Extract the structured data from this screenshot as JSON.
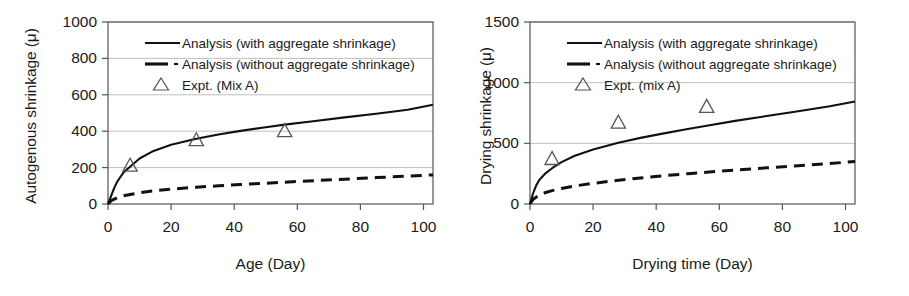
{
  "figure": {
    "background": "#ffffff",
    "axis_color": "#3a3a3a",
    "grid_color": "#bfbfbf",
    "series_color": "#111111",
    "marker_color": "#555555"
  },
  "panels": [
    {
      "id": "autogenous-shrinkage",
      "ylabel": "Autogenous shrinkage (μ)",
      "xlabel": "Age (Day)",
      "yticks": [
        "0",
        "200",
        "400",
        "600",
        "800",
        "1000"
      ],
      "xticks": [
        "0",
        "20",
        "40",
        "60",
        "80",
        "100"
      ],
      "legend": [
        {
          "marker": "solid-line",
          "label": "Analysis (with aggregate shrinkage)"
        },
        {
          "marker": "dash-dot-line",
          "label": "Analysis (without aggregate shrinkage)"
        },
        {
          "marker": "open-triangle",
          "label": "Expt. (Mix A)"
        }
      ]
    },
    {
      "id": "drying-shrinkage",
      "ylabel": "Drying shrinkage (μ)",
      "xlabel": "Drying time (Day)",
      "yticks": [
        "0",
        "500",
        "1000",
        "1500"
      ],
      "xticks": [
        "0",
        "20",
        "40",
        "60",
        "80",
        "100"
      ],
      "legend": [
        {
          "marker": "solid-line",
          "label": "Analysis (with aggregate shrinkage)"
        },
        {
          "marker": "dash-dot-line",
          "label": "Analysis (without aggregate shrinkage)"
        },
        {
          "marker": "open-triangle",
          "label": "Expt. (mix A)"
        }
      ]
    }
  ],
  "chart_data": [
    {
      "type": "line",
      "title": "",
      "xlabel": "Age (Day)",
      "ylabel": "Autogenous shrinkage (μ)",
      "xlim": [
        0,
        103
      ],
      "ylim": [
        0,
        1000
      ],
      "xticks": [
        0,
        20,
        40,
        60,
        80,
        100
      ],
      "yticks": [
        0,
        200,
        400,
        600,
        800,
        1000
      ],
      "grid": "horizontal",
      "legend_position": "upper-left-inside",
      "series": [
        {
          "name": "Analysis (with aggregate shrinkage)",
          "style": "solid",
          "x": [
            0,
            1,
            2,
            3,
            5,
            7,
            10,
            14,
            20,
            28,
            35,
            42,
            50,
            56,
            65,
            75,
            85,
            95,
            103
          ],
          "y": [
            0,
            45,
            90,
            125,
            175,
            205,
            250,
            288,
            325,
            358,
            382,
            402,
            422,
            436,
            455,
            476,
            496,
            518,
            545
          ]
        },
        {
          "name": "Analysis (without aggregate shrinkage)",
          "style": "dashed",
          "x": [
            0,
            1,
            3,
            5,
            7,
            10,
            14,
            20,
            28,
            35,
            42,
            50,
            56,
            65,
            75,
            85,
            95,
            103
          ],
          "y": [
            0,
            18,
            35,
            45,
            52,
            62,
            72,
            82,
            92,
            100,
            107,
            114,
            120,
            128,
            136,
            145,
            153,
            160
          ]
        },
        {
          "name": "Expt. (Mix A)",
          "style": "marker",
          "marker": "open-triangle",
          "x": [
            7,
            28,
            56
          ],
          "y": [
            210,
            350,
            400
          ]
        }
      ]
    },
    {
      "type": "line",
      "title": "",
      "xlabel": "Drying time (Day)",
      "ylabel": "Drying shrinkage (μ)",
      "xlim": [
        0,
        103
      ],
      "ylim": [
        0,
        1500
      ],
      "xticks": [
        0,
        20,
        40,
        60,
        80,
        100
      ],
      "yticks": [
        0,
        500,
        1000,
        1500
      ],
      "grid": "horizontal",
      "legend_position": "upper-left-inside",
      "series": [
        {
          "name": "Analysis (with aggregate shrinkage)",
          "style": "solid",
          "x": [
            0,
            1,
            2,
            3,
            5,
            7,
            10,
            14,
            20,
            28,
            35,
            42,
            50,
            56,
            65,
            75,
            85,
            95,
            103
          ],
          "y": [
            0,
            90,
            155,
            200,
            255,
            295,
            345,
            395,
            450,
            505,
            545,
            580,
            618,
            645,
            685,
            725,
            765,
            805,
            845
          ]
        },
        {
          "name": "Analysis (without aggregate shrinkage)",
          "style": "dashed",
          "x": [
            0,
            1,
            3,
            5,
            7,
            10,
            14,
            20,
            28,
            35,
            42,
            50,
            56,
            65,
            75,
            85,
            95,
            103
          ],
          "y": [
            0,
            40,
            75,
            95,
            110,
            128,
            148,
            170,
            196,
            215,
            232,
            250,
            262,
            280,
            298,
            316,
            334,
            350
          ]
        },
        {
          "name": "Expt. (mix A)",
          "style": "marker",
          "marker": "open-triangle",
          "x": [
            7,
            28,
            56
          ],
          "y": [
            370,
            670,
            800
          ]
        }
      ]
    }
  ]
}
